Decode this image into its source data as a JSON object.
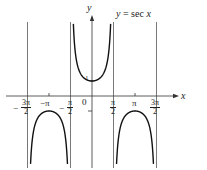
{
  "chart_data": {
    "type": "line",
    "title": "y = sec x",
    "function": "sec x",
    "xlabel": "x",
    "ylabel": "y",
    "origin_label": "0",
    "x_tick_labels": [
      {
        "label": "-3π/2",
        "sign": "−",
        "num": "3π",
        "den": "2",
        "value": -4.712
      },
      {
        "label": "-π",
        "text": "−π",
        "value": -3.1416
      },
      {
        "label": "-π/2",
        "sign": "−",
        "num": "π",
        "den": "2",
        "value": -1.5708
      },
      {
        "label": "π/2",
        "num": "π",
        "den": "2",
        "value": 1.5708
      },
      {
        "label": "π",
        "text": "π",
        "value": 3.1416
      },
      {
        "label": "3π/2",
        "num": "3π",
        "den": "2",
        "value": 4.712
      }
    ],
    "y_tick_labels": [
      {
        "label": "1",
        "value": 1
      }
    ],
    "vertical_asymptotes": [
      -4.712,
      -1.5708,
      1.5708,
      4.712
    ],
    "xlim": [
      -6.4,
      6.0
    ],
    "ylim": [
      -5.0,
      6.2
    ],
    "grid": false,
    "legend": null,
    "branches": [
      {
        "domain": [
          -4.712,
          -1.5708
        ],
        "shape": "downward U",
        "max": {
          "x": -3.1416,
          "y": -1
        }
      },
      {
        "domain": [
          -1.5708,
          1.5708
        ],
        "shape": "upward U",
        "min": {
          "x": 0,
          "y": 1
        }
      },
      {
        "domain": [
          1.5708,
          4.712
        ],
        "shape": "downward U",
        "max": {
          "x": 3.1416,
          "y": -1
        }
      }
    ],
    "colors": {
      "curve": "#111111",
      "axes": "#333333",
      "asymptote": "#555555"
    }
  },
  "labels": {
    "equation": "y = sec x",
    "y_axis": "y",
    "x_axis": "x",
    "origin": "0",
    "one": "1",
    "neg_pi": "−π",
    "pi": "π",
    "minus": "−",
    "three_pi": "3π",
    "pi_sym": "π",
    "two": "2"
  }
}
